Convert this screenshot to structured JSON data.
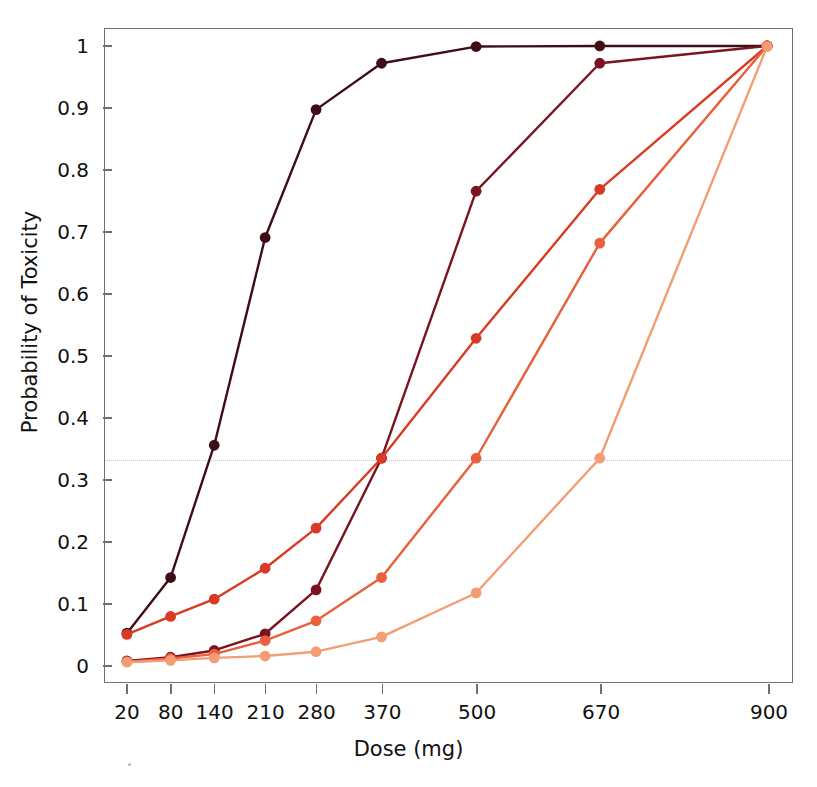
{
  "axes": {
    "x_title": "Dose (mg)",
    "y_title": "Probability of Toxicity",
    "x_ticks": [
      "20",
      "80",
      "140",
      "210",
      "280",
      "370",
      "500",
      "670",
      "900"
    ],
    "y_ticks": [
      "0",
      "0.1",
      "0.2",
      "0.3",
      "0.4",
      "0.5",
      "0.6",
      "0.7",
      "0.8",
      "0.9",
      "1"
    ]
  },
  "chart_data": {
    "type": "line",
    "title": "",
    "xlabel": "Dose (mg)",
    "ylabel": "Probability of Toxicity",
    "x": [
      20,
      80,
      140,
      210,
      280,
      370,
      500,
      670,
      900
    ],
    "xlim": [
      20,
      900
    ],
    "ylim": [
      0,
      1
    ],
    "xscale": "linear",
    "grid": false,
    "legend": "none",
    "reference_line": {
      "y": 0.333,
      "style": "dotted",
      "color": "#c9c9d6"
    },
    "series": [
      {
        "name": "scenario-1",
        "color": "#3f0d15",
        "values": [
          0.05,
          0.14,
          0.354,
          0.69,
          0.897,
          0.972,
          0.999,
          1.0,
          1.0
        ]
      },
      {
        "name": "scenario-2",
        "color": "#7a1420",
        "values": [
          0.005,
          0.011,
          0.022,
          0.049,
          0.12,
          0.333,
          0.765,
          0.972,
          1.0
        ]
      },
      {
        "name": "scenario-3",
        "color": "#d93a23",
        "values": [
          0.048,
          0.077,
          0.105,
          0.155,
          0.22,
          0.333,
          0.527,
          0.768,
          1.0
        ]
      },
      {
        "name": "scenario-4",
        "color": "#e8603c",
        "values": [
          0.004,
          0.009,
          0.016,
          0.038,
          0.07,
          0.14,
          0.333,
          0.681,
          1.0
        ]
      },
      {
        "name": "scenario-5",
        "color": "#f39d74",
        "values": [
          0.003,
          0.006,
          0.01,
          0.013,
          0.02,
          0.044,
          0.115,
          0.333,
          0.999
        ]
      }
    ]
  }
}
